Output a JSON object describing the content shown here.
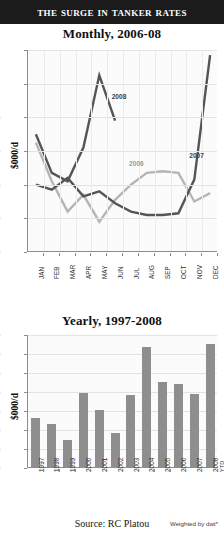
{
  "header": {
    "title": "The Surge in Tanker Rates"
  },
  "footer": {
    "source": "Source: RC Platou",
    "note": "Weighted by dwt*"
  },
  "colors": {
    "banner_bg": "#1b1b1b",
    "banner_text": "#ffffff",
    "plot_bg": "#fbfbfb",
    "grid": "#e3e3e3",
    "axis": "#8d8d8d",
    "series_dark": "#555555",
    "series_light": "#b5b5b5",
    "bar": "#8e8e8e"
  },
  "chart_data": [
    {
      "id": "monthly",
      "type": "line",
      "title": "Monthly, 2006-08",
      "xlabel": "",
      "ylabel": "$000/d",
      "ylim": [
        0,
        120
      ],
      "yticks": [
        0,
        20,
        40,
        60,
        80,
        100,
        120
      ],
      "ytick_labels": [
        "0",
        "20",
        "40",
        "60",
        "80",
        "100",
        "120"
      ],
      "grid": true,
      "legend": "inline-annotations",
      "categories": [
        "JAN",
        "FEB",
        "MAR",
        "APR",
        "MAY",
        "JUN",
        "JUL",
        "AUG",
        "SEP",
        "OCT",
        "NOV",
        "DEC"
      ],
      "series": [
        {
          "name": "2006",
          "color": "#b5b5b5",
          "label_x_index": 6.2,
          "label_y": 52,
          "values": [
            65,
            42,
            24,
            34,
            18,
            31,
            40,
            47,
            48,
            47,
            30,
            35
          ]
        },
        {
          "name": "2007",
          "color": "#555555",
          "label_x_index": 10.0,
          "label_y": 57,
          "values": [
            40,
            37,
            44,
            33,
            36,
            29,
            24,
            22,
            22,
            23,
            43,
            117
          ]
        },
        {
          "name": "2008",
          "color": "#555555",
          "label_x_index": 5.1,
          "label_y": 92,
          "values": [
            70,
            47,
            42,
            62,
            105,
            78,
            null,
            null,
            null,
            null,
            null,
            null
          ]
        }
      ]
    },
    {
      "id": "yearly",
      "type": "bar",
      "title": "Yearly, 1997-2008",
      "xlabel": "",
      "ylabel": "$000/d",
      "ylim": [
        0,
        70
      ],
      "yticks": [
        0,
        10,
        20,
        30,
        40,
        50,
        60,
        70
      ],
      "ytick_labels": [
        "0",
        "10",
        "20",
        "30",
        "40",
        "50",
        "60",
        "70"
      ],
      "grid": true,
      "categories": [
        "1997",
        "1998",
        "1999",
        "2000",
        "2001",
        "2002",
        "2003",
        "2004",
        "2005",
        "2006",
        "2007",
        "2008"
      ],
      "category_sublabels": [
        "",
        "",
        "",
        "",
        "",
        "",
        "",
        "",
        "",
        "",
        "",
        "YTD"
      ],
      "values": [
        26,
        22.5,
        14,
        39,
        30,
        18,
        38,
        63,
        44.5,
        43.5,
        38.5,
        65
      ]
    }
  ]
}
